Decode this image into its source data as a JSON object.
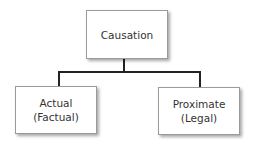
{
  "diagram": {
    "type": "hierarchy-tree",
    "root": {
      "label": "Causation"
    },
    "children": [
      {
        "label": "Actual\n(Factual)"
      },
      {
        "label": "Proximate\n(Legal)"
      }
    ],
    "colors": {
      "box_border": "#9a9a9a",
      "box_fill": "#ffffff",
      "connector": "#222222",
      "text": "#333333"
    }
  }
}
